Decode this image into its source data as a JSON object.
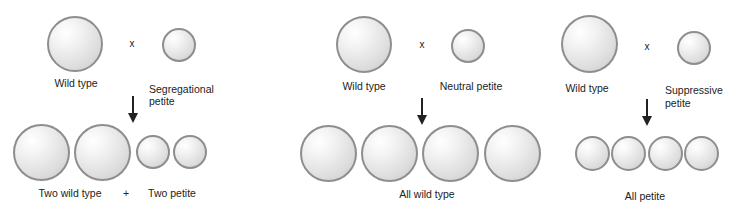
{
  "panels": [
    {
      "name": "segregational",
      "cross_symbol": "x",
      "parent1_label": "Wild type",
      "parent2_label_line1": "Segregational",
      "parent2_label_line2": "petite",
      "progeny_label_left": "Two wild type",
      "plus_symbol": "+",
      "progeny_label_right": "Two petite"
    },
    {
      "name": "neutral",
      "cross_symbol": "x",
      "parent1_label": "Wild type",
      "parent2_label": "Neutral petite",
      "progeny_label": "All wild type"
    },
    {
      "name": "suppressive",
      "cross_symbol": "x",
      "parent1_label": "Wild type",
      "parent2_label_line1": "Suppressive",
      "parent2_label_line2": "petite",
      "progeny_label": "All petite"
    }
  ],
  "colors": {
    "cell_border": "#8e8e8e",
    "text": "#222222",
    "arrow": "#222222"
  }
}
